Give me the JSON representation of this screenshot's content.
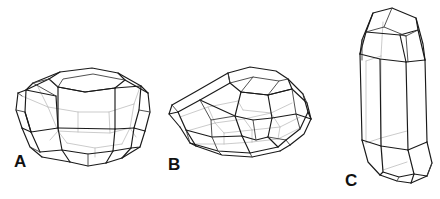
{
  "figure": {
    "background_color": "#ffffff",
    "line_color": "#1a1a1a",
    "hidden_line_color": "#b9b9b9",
    "label_color": "#111111",
    "panel_count": 3
  },
  "panels": [
    {
      "id": "A",
      "label": "A",
      "name": "crystal-a",
      "description": "Equant rounded polyhedral crystal with large hexagonal top face and multiple prism and pyramid faces",
      "label_x": 14,
      "label_y": 167,
      "faces_visible": 13
    },
    {
      "id": "B",
      "label": "B",
      "name": "crystal-b",
      "description": "Tilted tabular polyhedral crystal viewed from above showing broad basal face and beveled edges",
      "label_x": 168,
      "label_y": 170,
      "faces_visible": 12
    },
    {
      "id": "C",
      "label": "C",
      "name": "crystal-c",
      "description": "Elongate prismatic crystal with hexagonal cross section and terminating pyramid faces at both ends",
      "label_x": 345,
      "label_y": 186,
      "faces_visible": 10
    }
  ]
}
